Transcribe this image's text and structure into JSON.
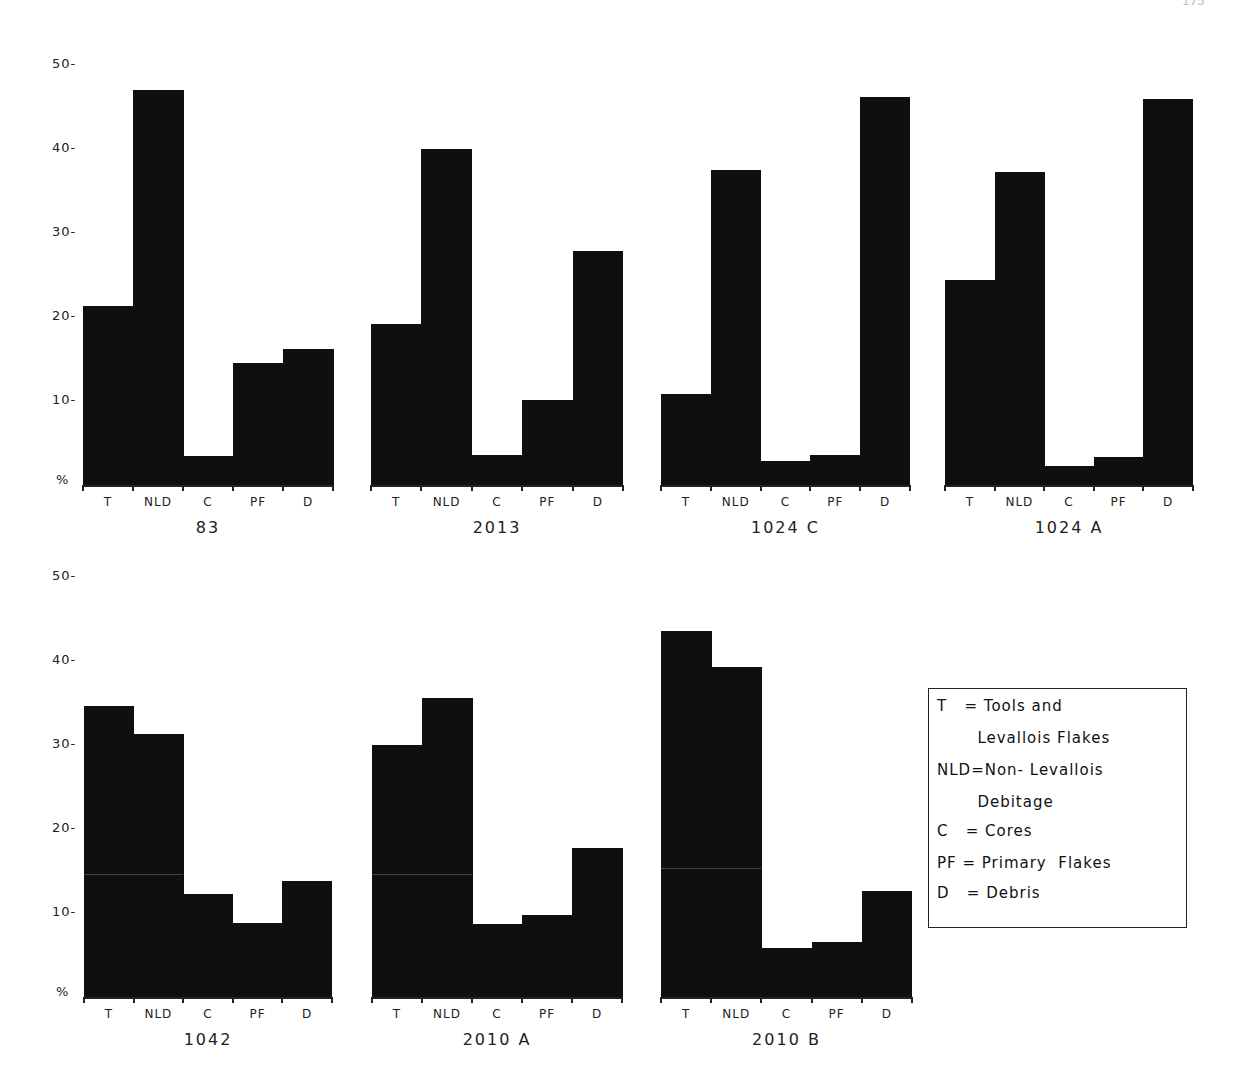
{
  "page": {
    "page_number": "175"
  },
  "axis": {
    "yticks": [
      "50-",
      "40-",
      "30-",
      "20-",
      "10-"
    ],
    "unit_label": "%"
  },
  "legend": {
    "lines": [
      "T   = Tools and",
      "       Levallois Flakes",
      "NLD=Non- Levallois",
      "       Debitage",
      "C   = Cores",
      "PF = Primary  Flakes",
      "D   = Debris"
    ]
  },
  "chart_data": [
    {
      "type": "bar",
      "title": "83",
      "categories": [
        "T",
        "NLD",
        "C",
        "PF",
        "D"
      ],
      "values": [
        21.3,
        47.0,
        3.5,
        14.5,
        16.2
      ],
      "ylabel": "%",
      "ylim": [
        0,
        50
      ],
      "grid": false
    },
    {
      "type": "bar",
      "title": "2013",
      "categories": [
        "T",
        "NLD",
        "C",
        "PF",
        "D"
      ],
      "values": [
        19.2,
        40.0,
        3.6,
        10.1,
        27.8
      ],
      "ylabel": "%",
      "ylim": [
        0,
        50
      ],
      "grid": false
    },
    {
      "type": "bar",
      "title": "1024 C",
      "categories": [
        "T",
        "NLD",
        "C",
        "PF",
        "D"
      ],
      "values": [
        10.8,
        37.5,
        2.8,
        3.6,
        46.2
      ],
      "ylabel": "%",
      "ylim": [
        0,
        50
      ],
      "grid": false
    },
    {
      "type": "bar",
      "title": "1024 A",
      "categories": [
        "T",
        "NLD",
        "C",
        "PF",
        "D"
      ],
      "values": [
        24.4,
        37.3,
        2.3,
        3.3,
        46.0
      ],
      "ylabel": "%",
      "ylim": [
        0,
        50
      ],
      "grid": false
    },
    {
      "type": "bar",
      "title": "1042",
      "categories": [
        "T",
        "NLD",
        "C",
        "PF",
        "D"
      ],
      "values": [
        34.6,
        31.3,
        12.3,
        8.8,
        13.8
      ],
      "ylabel": "%",
      "ylim": [
        0,
        50
      ],
      "grid": false
    },
    {
      "type": "bar",
      "title": "2010 A",
      "categories": [
        "T",
        "NLD",
        "C",
        "PF",
        "D"
      ],
      "values": [
        30.0,
        35.6,
        8.7,
        9.8,
        17.7
      ],
      "ylabel": "%",
      "ylim": [
        0,
        50
      ],
      "grid": false
    },
    {
      "type": "bar",
      "title": "2010 B",
      "categories": [
        "T",
        "NLD",
        "C",
        "PF",
        "D"
      ],
      "values": [
        43.6,
        39.3,
        5.8,
        6.5,
        12.6
      ],
      "ylabel": "%",
      "ylim": [
        0,
        50
      ],
      "grid": false
    }
  ],
  "layout": {
    "rows": [
      {
        "zero_y": 485,
        "px_per_unit": 8.4,
        "panels": [
          0,
          1,
          2,
          3
        ],
        "tick_label_x": 52,
        "streak": false
      },
      {
        "zero_y": 997,
        "px_per_unit": 8.4,
        "panels": [
          4,
          5,
          6
        ],
        "tick_label_x": 52,
        "streak": true
      }
    ],
    "panel_x": [
      [
        83,
        333
      ],
      [
        371,
        623
      ],
      [
        661,
        910
      ],
      [
        945,
        1193
      ],
      [
        84,
        332
      ],
      [
        372,
        622
      ],
      [
        661,
        912
      ]
    ]
  }
}
